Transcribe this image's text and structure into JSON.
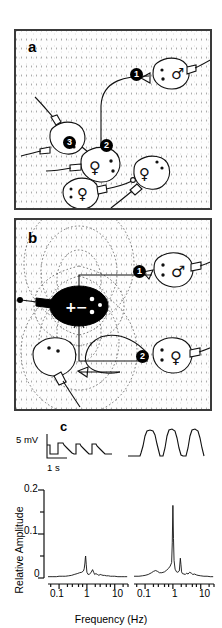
{
  "figure": {
    "panels": [
      {
        "id": "a",
        "letter": "a",
        "caption_letter": "a",
        "description": "Aquarium top view with five electric fish, each with a recording electrode; playback/interaction events numbered 1-3",
        "markers": [
          "1",
          "2",
          "3"
        ],
        "fish": [
          {
            "sex_symbol": "♂",
            "label": "male-fish-top-right"
          },
          {
            "sex_symbol": "♀",
            "label": "female-fish-center"
          },
          {
            "sex_symbol": "",
            "label": "fish-left-marker-3"
          },
          {
            "sex_symbol": "♀",
            "label": "female-fish-lower-left"
          },
          {
            "sex_symbol": "♀",
            "label": "female-fish-lower-right"
          }
        ]
      },
      {
        "id": "b",
        "letter": "b",
        "caption_letter": "b",
        "description": "Aquarium top view with a dipole stimulus fish (black) surrounded by dashed electric field lines, plus a male and a female fish; events numbered 1-2",
        "markers": [
          "1",
          "2"
        ],
        "dipole_signs": [
          "+",
          "−"
        ],
        "fish": [
          {
            "sex_symbol": "♂",
            "label": "male-fish-right-top"
          },
          {
            "sex_symbol": "♀",
            "label": "female-fish-right-bottom"
          },
          {
            "sex_symbol": "",
            "label": "white-fish-lower-left"
          },
          {
            "sex_symbol": "",
            "label": "black-dipole-fish"
          }
        ]
      }
    ],
    "traces": {
      "letter": "c",
      "voltage_scale": "5 mV",
      "time_scale": "1 s",
      "left_trace_name": "left-voltage-trace",
      "right_trace_name": "right-voltage-trace"
    }
  },
  "chart_data": [
    {
      "type": "line",
      "name": "left-power-spectrum",
      "title": "",
      "xlabel": "Frequency (Hz)",
      "ylabel": "Relative Amplitude",
      "xscale": "log",
      "xlim": [
        0.04,
        30
      ],
      "ylim": [
        0,
        0.2
      ],
      "yticks": [
        0,
        0.1,
        0.2
      ],
      "yticks_minor": [
        0.05,
        0.15
      ],
      "xticks": [
        0.1,
        1,
        10
      ],
      "xtick_labels": [
        "0.1",
        "1",
        "10"
      ],
      "grid": false,
      "legend": "none",
      "x": [
        0.04,
        0.06,
        0.08,
        0.1,
        0.13,
        0.17,
        0.22,
        0.28,
        0.35,
        0.45,
        0.55,
        0.65,
        0.75,
        0.8,
        0.85,
        0.88,
        0.9,
        0.95,
        1.0,
        1.1,
        1.25,
        1.4,
        1.6,
        1.75,
        1.9,
        2.1,
        2.4,
        2.7,
        3.0,
        3.4,
        3.8,
        4.3,
        5.0,
        6.0,
        7.0,
        8.5,
        10,
        13,
        17,
        22,
        28
      ],
      "y": [
        0.003,
        0.003,
        0.003,
        0.004,
        0.004,
        0.004,
        0.005,
        0.006,
        0.008,
        0.01,
        0.012,
        0.013,
        0.016,
        0.021,
        0.034,
        0.046,
        0.05,
        0.03,
        0.013,
        0.008,
        0.009,
        0.012,
        0.019,
        0.013,
        0.008,
        0.01,
        0.008,
        0.006,
        0.008,
        0.007,
        0.006,
        0.006,
        0.005,
        0.005,
        0.004,
        0.004,
        0.004,
        0.003,
        0.003,
        0.003,
        0.003
      ],
      "peaks": [
        {
          "freq": 0.9,
          "amplitude": 0.05
        },
        {
          "freq": 1.6,
          "amplitude": 0.019
        }
      ]
    },
    {
      "type": "line",
      "name": "right-power-spectrum",
      "title": "",
      "xlabel": "Frequency (Hz)",
      "ylabel": "Relative Amplitude",
      "xscale": "log",
      "xlim": [
        0.04,
        30
      ],
      "ylim": [
        0,
        0.2
      ],
      "yticks": [
        0,
        0.1,
        0.2
      ],
      "yticks_minor": [
        0.05,
        0.15
      ],
      "xticks": [
        0.1,
        1,
        10
      ],
      "xtick_labels": [
        "0.1",
        "1",
        "10"
      ],
      "grid": false,
      "legend": "none",
      "x": [
        0.04,
        0.06,
        0.08,
        0.1,
        0.13,
        0.17,
        0.2,
        0.24,
        0.28,
        0.33,
        0.4,
        0.5,
        0.6,
        0.7,
        0.8,
        0.9,
        0.95,
        1.0,
        1.05,
        1.1,
        1.2,
        1.35,
        1.5,
        1.7,
        1.85,
        1.95,
        2.05,
        2.2,
        2.5,
        2.8,
        3.1,
        3.5,
        4.0,
        4.6,
        5.2,
        6.0,
        7.0,
        8.0,
        10,
        13,
        17,
        22,
        28
      ],
      "y": [
        0.004,
        0.004,
        0.005,
        0.006,
        0.008,
        0.012,
        0.015,
        0.017,
        0.015,
        0.012,
        0.012,
        0.014,
        0.018,
        0.022,
        0.027,
        0.035,
        0.08,
        0.165,
        0.09,
        0.04,
        0.02,
        0.014,
        0.013,
        0.016,
        0.045,
        0.03,
        0.014,
        0.01,
        0.009,
        0.008,
        0.011,
        0.009,
        0.013,
        0.011,
        0.008,
        0.009,
        0.007,
        0.006,
        0.005,
        0.004,
        0.004,
        0.003,
        0.003
      ],
      "peaks": [
        {
          "freq": 1.0,
          "amplitude": 0.165
        },
        {
          "freq": 1.85,
          "amplitude": 0.045
        }
      ]
    }
  ]
}
